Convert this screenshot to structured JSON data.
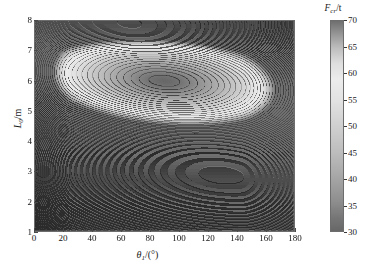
{
  "figure": {
    "type": "contour",
    "background": "#ffffff"
  },
  "axes": {
    "xlabel_var": "θ",
    "xlabel_sub": "1",
    "xlabel_unit": "/(°)",
    "ylabel_var": "L",
    "ylabel_sub": "0",
    "ylabel_unit": "/m",
    "xticks": [
      "0",
      "20",
      "40",
      "60",
      "80",
      "100",
      "120",
      "140",
      "160",
      "180"
    ],
    "yticks": [
      "1",
      "2",
      "3",
      "4",
      "5",
      "6",
      "7",
      "8"
    ]
  },
  "colorbar": {
    "title_var": "F",
    "title_sub": "cr",
    "title_unit": "/t",
    "ticks": [
      "70",
      "65",
      "60",
      "55",
      "50",
      "45",
      "40",
      "35",
      "30"
    ]
  },
  "chart_data": {
    "type": "heatmap",
    "title": "",
    "xlabel": "θ1/(°)",
    "ylabel": "L0/m",
    "zlabel": "Fcr/t",
    "xlim": [
      0,
      180
    ],
    "ylim": [
      1,
      8
    ],
    "zlim": [
      30,
      70
    ],
    "grid": false,
    "legend_position": "right-colorbar",
    "contour_levels": [
      30,
      32,
      34,
      36,
      38,
      40,
      42,
      44,
      46,
      48,
      50,
      52,
      54,
      56,
      58,
      60,
      62,
      64,
      66,
      68,
      70
    ],
    "contour_interval": 2,
    "minimum": {
      "x": 90,
      "y": 6.0,
      "z": 30,
      "note": "dark closed basin centred near theta1=90 deg, L0=6 m"
    },
    "ridge": {
      "note": "light high-value ridge runs from lower-left to right, values rising toward x=180 and y=1"
    },
    "x_grid": [
      0,
      20,
      40,
      60,
      80,
      100,
      120,
      140,
      160,
      180
    ],
    "y_grid": [
      1,
      2,
      3,
      4,
      5,
      6,
      7,
      8
    ],
    "values": [
      [
        70,
        68,
        65,
        62,
        60,
        59,
        59,
        61,
        64,
        68
      ],
      [
        66,
        62,
        58,
        54,
        52,
        51,
        52,
        55,
        59,
        64
      ],
      [
        62,
        56,
        50,
        46,
        43,
        42,
        44,
        48,
        53,
        59
      ],
      [
        58,
        51,
        44,
        39,
        36,
        35,
        37,
        42,
        48,
        55
      ],
      [
        56,
        48,
        40,
        34,
        31,
        30,
        33,
        39,
        46,
        54
      ],
      [
        57,
        49,
        41,
        35,
        32,
        31,
        34,
        41,
        48,
        56
      ],
      [
        61,
        54,
        47,
        42,
        39,
        39,
        42,
        48,
        55,
        62
      ],
      [
        67,
        61,
        56,
        52,
        50,
        50,
        53,
        58,
        64,
        69
      ]
    ],
    "values_note": "rows correspond to y_grid from 8 down to 1; columns to x_grid 0..180"
  }
}
